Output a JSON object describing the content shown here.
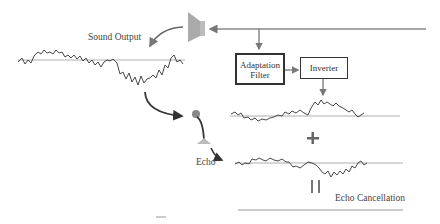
{
  "labels": {
    "sound_output": "Sound Output",
    "echo": "Echo",
    "echo_cancellation": "Echo Cancellation",
    "plus": "+",
    "equals": "||"
  },
  "blocks": {
    "adaptation_filter": "Adaptation Filter",
    "inverter": "Inverter"
  },
  "colors": {
    "line": "#888888",
    "wave": "#333333",
    "speaker": "#aaaaaa",
    "arrow_dark": "#333333"
  }
}
